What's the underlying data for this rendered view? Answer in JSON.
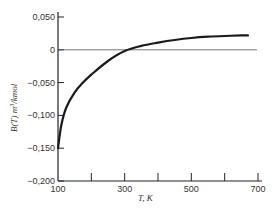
{
  "chart_data": {
    "type": "line",
    "title": "",
    "xlabel": "T, K",
    "ylabel": "B(T) m³/kmol",
    "xlim": [
      100,
      700
    ],
    "ylim": [
      -0.2,
      0.05
    ],
    "x_ticks": [
      100,
      200,
      300,
      400,
      500,
      600,
      700
    ],
    "x_tick_labels": [
      "100",
      "",
      "300",
      "",
      "500",
      "",
      "700"
    ],
    "y_ticks": [
      0.05,
      0,
      -0.05,
      -0.1,
      -0.15,
      -0.2
    ],
    "y_tick_labels": [
      "0,050",
      "0",
      "−0,050",
      "−0,100",
      "−0,150",
      "−0,200"
    ],
    "grid": false,
    "reference_line": {
      "y": 0,
      "label": "zero line"
    },
    "series": [
      {
        "name": "B(T)",
        "x": [
          100,
          110,
          125,
          150,
          175,
          200,
          250,
          300,
          350,
          400,
          450,
          500,
          550,
          600,
          650,
          670
        ],
        "y": [
          -0.15,
          -0.115,
          -0.088,
          -0.065,
          -0.05,
          -0.038,
          -0.017,
          -0.002,
          0.006,
          0.011,
          0.015,
          0.018,
          0.02,
          0.021,
          0.022,
          0.022
        ]
      }
    ]
  },
  "labels": {
    "xlabel": "T, K",
    "ylabel_main": "B(T) m",
    "ylabel_sup": "3",
    "ylabel_tail": "/kmol"
  }
}
